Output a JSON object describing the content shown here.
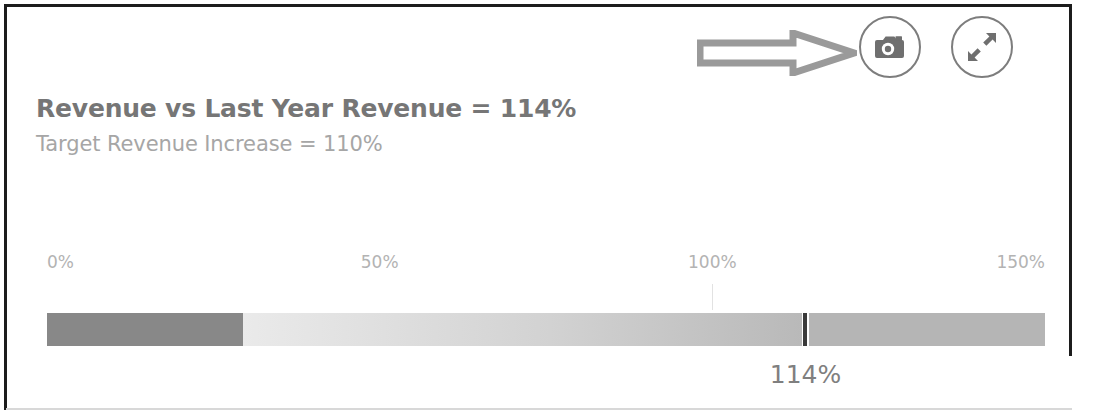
{
  "object": {
    "title": "Revenue vs Last Year Revenue = 114%",
    "subtitle": "Target Revenue Increase = 110%"
  },
  "toolbar": {
    "snapshot_label": "snapshot",
    "fullscreen_label": "fullscreen",
    "snapshot_icon": "camera-icon",
    "fullscreen_icon": "expand-arrows-icon",
    "arrow_icon": "right-arrow-annotation"
  },
  "colors": {
    "border": "#1c1c1c",
    "title": "#767676",
    "subtitle": "#a6a6a6",
    "tick": "#b3b3b3",
    "band_low": "#888888",
    "band_mid_start": "#eaeaea",
    "band_mid_end": "#b9b9b9",
    "band_high": "#b5b5b5",
    "marker": "#3a3a3a",
    "value_label": "#7f7f7f"
  },
  "chart_data": {
    "type": "bar",
    "chart_subtype": "bullet",
    "title": "Revenue vs Last Year Revenue = 114%",
    "subtitle": "Target Revenue Increase = 110%",
    "xlabel": "",
    "ylabel": "",
    "xlim": [
      0,
      150
    ],
    "grid": false,
    "legend": "none",
    "tick_values": [
      0,
      50,
      100,
      150
    ],
    "tick_labels": [
      "0%",
      "50%",
      "100%",
      "150%"
    ],
    "measure_label": "114%",
    "measure_value": 114,
    "target_value": 110,
    "marker_value": 114,
    "gridline_value": 100,
    "ranges": [
      {
        "name": "low",
        "from": 0,
        "to": 29.5,
        "color": "#888888"
      },
      {
        "name": "medium",
        "from": 29.5,
        "to": 113.5,
        "color": "#d2d2d2"
      },
      {
        "name": "high",
        "from": 114.5,
        "to": 150,
        "color": "#b5b5b5"
      }
    ]
  }
}
